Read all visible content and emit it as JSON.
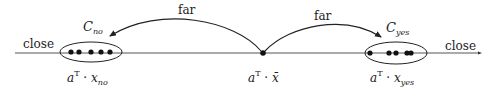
{
  "diagram": {
    "labels": {
      "close_left": "close",
      "close_right": "close",
      "far_left": "far",
      "far_right": "far",
      "cluster_no": {
        "base": "C",
        "sub": "no"
      },
      "cluster_yes": {
        "base": "C",
        "sub": "yes"
      },
      "proj_no": {
        "base": "a",
        "sup": "T",
        "op": " · ",
        "var": "x",
        "sub": "no"
      },
      "proj_center": {
        "base": "a",
        "sup": "T",
        "op": " · ",
        "var": "x̄"
      },
      "proj_yes": {
        "base": "a",
        "sup": "T",
        "op": " · ",
        "var": "x",
        "sub": "yes"
      }
    },
    "colors": {
      "line": "#555555",
      "dot": "#111111",
      "text": "#222222",
      "arrow": "#222222"
    },
    "clusters": [
      {
        "name": "no",
        "dots_x": [
          71,
          79,
          91,
          101,
          111
        ]
      },
      {
        "name": "yes",
        "dots_x": [
          369,
          389,
          395,
          407,
          411
        ]
      }
    ],
    "center_point_x": 263
  }
}
